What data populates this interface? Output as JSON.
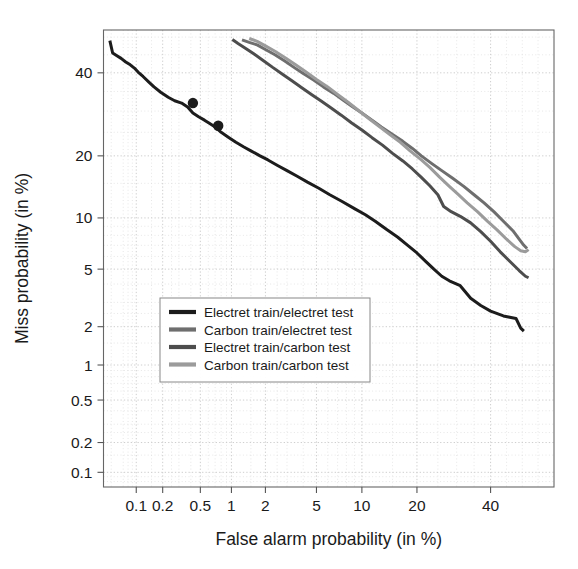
{
  "chart_data": {
    "type": "line",
    "title": "",
    "subtitle": "",
    "xlabel": "False alarm probability (in %)",
    "ylabel": "Miss probability (in %)",
    "scale": "normal-deviate (DET curve)",
    "grid": true,
    "legend_position": "lower-center-inside",
    "xlim": [
      0.04,
      60
    ],
    "ylim": [
      0.07,
      52
    ],
    "xticks": [
      "0.1",
      "0.2",
      "0.5",
      "1",
      "2",
      "5",
      "10",
      "20",
      "40"
    ],
    "xtick_values": [
      0.1,
      0.2,
      0.5,
      1,
      2,
      5,
      10,
      20,
      40
    ],
    "yticks": [
      "40",
      "20",
      "10",
      "5",
      "2",
      "1",
      "0.5",
      "0.2",
      "0.1"
    ],
    "ytick_values": [
      40,
      20,
      10,
      5,
      2,
      1,
      0.5,
      0.2,
      0.1
    ],
    "series": [
      {
        "name": "Electret train/electret test",
        "color": "#1c1c1c",
        "width": 3.0,
        "points": [
          [
            0.048,
            49.0
          ],
          [
            0.052,
            45.5
          ],
          [
            0.058,
            44.8
          ],
          [
            0.066,
            44.0
          ],
          [
            0.075,
            43.0
          ],
          [
            0.085,
            42.2
          ],
          [
            0.095,
            41.3
          ],
          [
            0.105,
            40.2
          ],
          [
            0.12,
            39.0
          ],
          [
            0.14,
            37.5
          ],
          [
            0.16,
            36.2
          ],
          [
            0.19,
            34.8
          ],
          [
            0.23,
            33.5
          ],
          [
            0.27,
            32.6
          ],
          [
            0.32,
            32.0
          ],
          [
            0.37,
            31.0
          ],
          [
            0.42,
            29.5
          ],
          [
            0.48,
            28.6
          ],
          [
            0.55,
            27.8
          ],
          [
            0.62,
            27.0
          ],
          [
            0.7,
            26.2
          ],
          [
            0.8,
            25.0
          ],
          [
            0.95,
            23.8
          ],
          [
            1.1,
            22.8
          ],
          [
            1.3,
            21.8
          ],
          [
            1.5,
            21.0
          ],
          [
            1.8,
            20.0
          ],
          [
            2.1,
            19.2
          ],
          [
            2.5,
            18.2
          ],
          [
            3.0,
            17.2
          ],
          [
            3.6,
            16.2
          ],
          [
            4.3,
            15.2
          ],
          [
            5.2,
            14.2
          ],
          [
            6.2,
            13.2
          ],
          [
            7.5,
            12.2
          ],
          [
            9.0,
            11.2
          ],
          [
            10.5,
            10.4
          ],
          [
            12.0,
            9.6
          ],
          [
            14.0,
            8.6
          ],
          [
            16.0,
            7.8
          ],
          [
            18.0,
            7.0
          ],
          [
            20.0,
            6.3
          ],
          [
            22.0,
            5.6
          ],
          [
            24.0,
            5.0
          ],
          [
            26.0,
            4.5
          ],
          [
            28.0,
            4.2
          ],
          [
            31.0,
            3.9
          ],
          [
            34.0,
            3.2
          ],
          [
            37.0,
            2.85
          ],
          [
            40.0,
            2.6
          ],
          [
            44.0,
            2.4
          ],
          [
            46.0,
            2.35
          ],
          [
            48.0,
            2.3
          ],
          [
            49.5,
            1.95
          ],
          [
            50.5,
            1.85
          ]
        ],
        "markers": [
          [
            0.42,
            32.0
          ],
          [
            0.75,
            26.5
          ]
        ]
      },
      {
        "name": "Carbon train/electret test",
        "color": "#6e6e6e",
        "width": 3.0,
        "points": [
          [
            1.25,
            49.2
          ],
          [
            1.45,
            48.5
          ],
          [
            1.7,
            47.8
          ],
          [
            2.0,
            46.5
          ],
          [
            2.4,
            45.0
          ],
          [
            2.9,
            43.2
          ],
          [
            3.4,
            41.5
          ],
          [
            4.0,
            39.8
          ],
          [
            4.8,
            38.0
          ],
          [
            5.6,
            36.2
          ],
          [
            6.6,
            34.5
          ],
          [
            7.6,
            32.8
          ],
          [
            8.8,
            31.0
          ],
          [
            10.0,
            29.5
          ],
          [
            11.5,
            27.8
          ],
          [
            13.0,
            26.2
          ],
          [
            15.0,
            24.5
          ],
          [
            17.0,
            23.0
          ],
          [
            19.0,
            21.5
          ],
          [
            21.0,
            20.0
          ],
          [
            23.5,
            18.5
          ],
          [
            26.0,
            17.2
          ],
          [
            29.0,
            15.8
          ],
          [
            32.0,
            14.5
          ],
          [
            35.0,
            13.2
          ],
          [
            38.0,
            12.0
          ],
          [
            41.0,
            10.8
          ],
          [
            44.0,
            9.6
          ],
          [
            47.0,
            8.5
          ],
          [
            49.0,
            7.6
          ],
          [
            50.5,
            7.0
          ],
          [
            51.5,
            6.7
          ]
        ],
        "markers": []
      },
      {
        "name": "Electret train/carbon test",
        "color": "#4d4d4d",
        "width": 3.0,
        "points": [
          [
            1.02,
            49.3
          ],
          [
            1.15,
            48.2
          ],
          [
            1.35,
            46.8
          ],
          [
            1.6,
            45.2
          ],
          [
            1.9,
            43.5
          ],
          [
            2.3,
            41.5
          ],
          [
            2.8,
            39.5
          ],
          [
            3.3,
            37.8
          ],
          [
            3.9,
            36.0
          ],
          [
            4.6,
            34.2
          ],
          [
            5.4,
            32.5
          ],
          [
            6.3,
            30.8
          ],
          [
            7.4,
            29.0
          ],
          [
            8.6,
            27.2
          ],
          [
            10.0,
            25.5
          ],
          [
            11.5,
            23.8
          ],
          [
            13.2,
            22.2
          ],
          [
            15.0,
            20.5
          ],
          [
            17.0,
            19.0
          ],
          [
            19.0,
            17.5
          ],
          [
            21.0,
            16.0
          ],
          [
            23.0,
            14.6
          ],
          [
            25.0,
            13.2
          ],
          [
            26.5,
            11.5
          ],
          [
            28.5,
            10.8
          ],
          [
            31.0,
            10.2
          ],
          [
            34.0,
            9.4
          ],
          [
            37.0,
            8.4
          ],
          [
            40.0,
            7.4
          ],
          [
            43.0,
            6.4
          ],
          [
            46.0,
            5.6
          ],
          [
            49.0,
            4.9
          ],
          [
            51.0,
            4.5
          ],
          [
            52.0,
            4.4
          ]
        ],
        "markers": []
      },
      {
        "name": "Carbon train/carbon test",
        "color": "#9b9b9b",
        "width": 3.0,
        "points": [
          [
            1.45,
            49.6
          ],
          [
            1.7,
            48.8
          ],
          [
            2.0,
            47.5
          ],
          [
            2.4,
            46.0
          ],
          [
            2.9,
            44.2
          ],
          [
            3.5,
            42.2
          ],
          [
            4.2,
            40.2
          ],
          [
            5.0,
            38.2
          ],
          [
            6.0,
            36.2
          ],
          [
            7.0,
            34.2
          ],
          [
            8.2,
            32.2
          ],
          [
            9.5,
            30.2
          ],
          [
            11.0,
            28.2
          ],
          [
            12.5,
            26.5
          ],
          [
            14.5,
            24.5
          ],
          [
            16.5,
            22.8
          ],
          [
            18.5,
            21.0
          ],
          [
            21.0,
            19.2
          ],
          [
            23.0,
            17.8
          ],
          [
            25.5,
            16.0
          ],
          [
            28.0,
            14.5
          ],
          [
            30.5,
            13.2
          ],
          [
            33.0,
            12.0
          ],
          [
            36.0,
            10.8
          ],
          [
            39.0,
            9.6
          ],
          [
            42.0,
            8.6
          ],
          [
            45.0,
            7.6
          ],
          [
            47.5,
            6.9
          ],
          [
            49.5,
            6.5
          ],
          [
            51.0,
            6.4
          ],
          [
            52.0,
            6.6
          ]
        ],
        "markers": []
      }
    ]
  },
  "legend": {
    "items": [
      {
        "label": "Electret train/electret test",
        "color": "#1c1c1c"
      },
      {
        "label": "Carbon train/electret test",
        "color": "#6e6e6e"
      },
      {
        "label": "Electret train/carbon test",
        "color": "#4d4d4d"
      },
      {
        "label": "Carbon train/carbon test",
        "color": "#9b9b9b"
      }
    ]
  },
  "axes": {
    "x_title": "False alarm probability (in %)",
    "y_title": "Miss probability (in %)"
  }
}
